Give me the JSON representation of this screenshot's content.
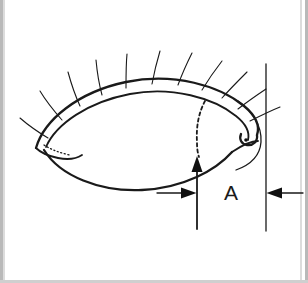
{
  "figure": {
    "background_color": "#ffffff",
    "ink_color": "#1a1a1a",
    "width": 308,
    "height": 283
  },
  "annotation": {
    "measure_label": "A",
    "measure_label_x": 231,
    "measure_label_y": 194,
    "reference_line": {
      "x": 266,
      "y_top": 64,
      "y_bottom": 231
    },
    "vertical_arrow": {
      "x": 197,
      "y_tail": 229,
      "y_tip": 157
    },
    "left_arrow": {
      "x_tail": 157,
      "x_tip": 196,
      "y": 193
    },
    "right_arrow": {
      "x_tail": 303,
      "x_tip": 267,
      "y": 193
    }
  },
  "anatomy": {
    "upper_lid_outer": "M 36 148 C 44 120 78 92 126 82 C 174 72 220 86 244 106 C 256 116 260 126 257 135",
    "upper_lid_inner": "M 46 147 C 56 124 88 102 130 94 C 172 86 214 98 236 116 C 246 124 250 132 248 140",
    "lid_margin_tip": "M 257 135 C 258 141 253 146 247 145 C 241 144 239 139 241 134",
    "lower_lid": "M 44 150 C 60 176 100 192 142 190 C 184 188 216 170 232 152",
    "lower_lid_outer": "M 232 152 C 244 144 252 141 258 141",
    "medial_canthus": "M 36 148 C 40 152 48 156 58 158 C 68 160 76 159 82 155",
    "caruncle_dots": "M 44 145 C 52 150 60 153 70 155",
    "iris_dash": "M 205 101 C 199 112 196 126 197 142 C 197 150 198 154 199 157",
    "lateral_skin_arc": "M 238 101 C 252 110 262 126 261 142 C 260 156 250 165 236 170",
    "canthus_dot_x": 246,
    "canthus_dot_y": 140,
    "canthus_dot_r": 1.8,
    "eyelashes": [
      "M 48 138 C 38 132 28 125 20 118",
      "M 62 120 C 54 111 46 101 40 91",
      "M 80 106 C 75 95 71 83 68 72",
      "M 102 95 C 99 84 97 71 96 60",
      "M 126 88 C 126 76 126 64 127 54",
      "M 152 84 C 154 73 157 61 160 51",
      "M 178 85 C 182 74 187 63 192 53",
      "M 202 90 C 208 80 215 70 222 61",
      "M 222 98 C 230 89 239 80 247 72",
      "M 238 109 C 247 102 257 95 266 89",
      "M 250 121 C 260 116 270 111 280 107"
    ]
  }
}
